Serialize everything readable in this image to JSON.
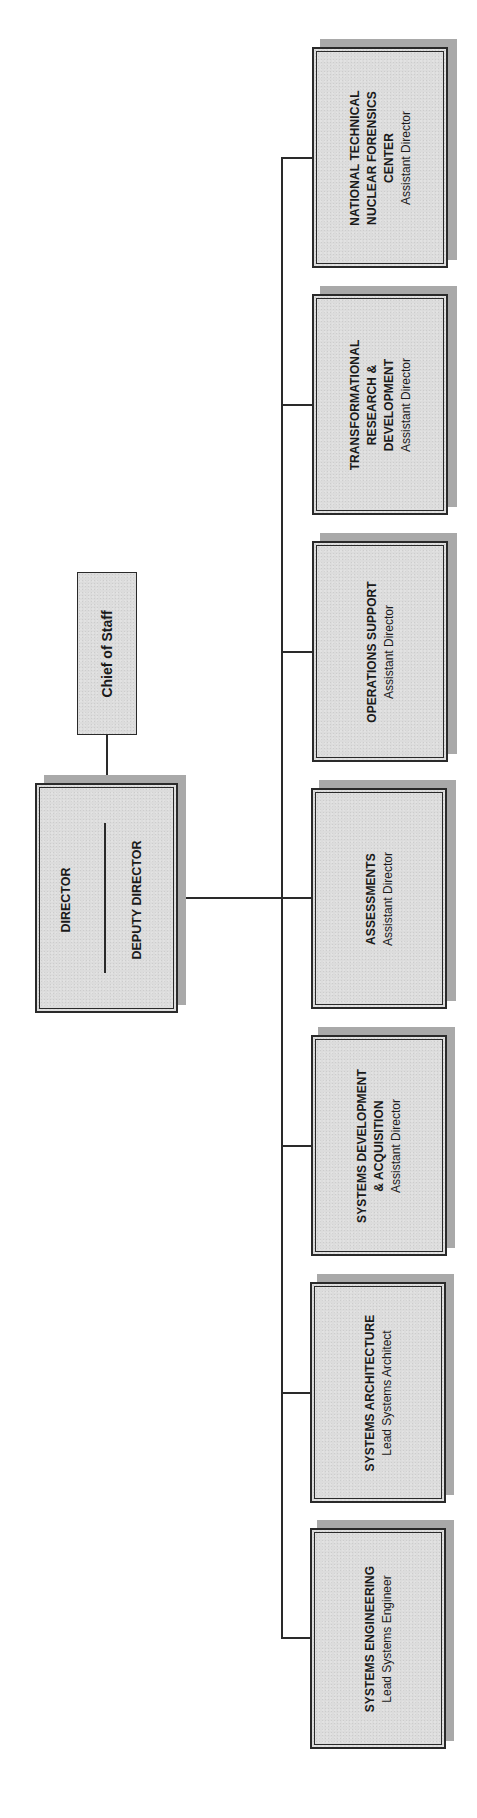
{
  "chart_title": "",
  "colors": {
    "box_fill": "#dcdcdc",
    "border": "#2a2a2a",
    "shadow": "#a9a9a9",
    "background": "#ffffff"
  },
  "orientation": "rotated 90 degrees counter-clockwise (text reads bottom-to-top)",
  "top_level": {
    "director": "DIRECTOR",
    "deputy_director": "DEPUTY DIRECTOR"
  },
  "staff": {
    "chief_of_staff": "Chief of Staff"
  },
  "divisions": [
    {
      "name": "NATIONAL TECHNICAL\nNUCLEAR FORENSICS\nCENTER",
      "head": "Assistant Director"
    },
    {
      "name": "TRANSFORMATIONAL\nRESEARCH &\nDEVELOPMENT",
      "head": "Assistant Director"
    },
    {
      "name": "OPERATIONS SUPPORT",
      "head": "Assistant Director"
    },
    {
      "name": "ASSESSMENTS",
      "head": "Assistant Director"
    },
    {
      "name": "SYSTEMS DEVELOPMENT\n& ACQUISITION",
      "head": "Assistant Director"
    },
    {
      "name": "SYSTEMS ARCHITECTURE",
      "head": "Lead Systems Architect"
    },
    {
      "name": "SYSTEMS ENGINEERING",
      "head": "Lead Systems Engineer"
    }
  ]
}
